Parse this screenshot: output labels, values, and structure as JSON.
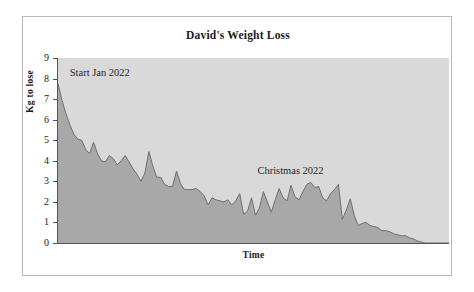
{
  "chart_data": {
    "type": "area",
    "title": "David's Weight Loss",
    "xlabel": "Time",
    "ylabel": "Kg to lose",
    "ylim": [
      0,
      9
    ],
    "ytick_labels": [
      "9",
      "8",
      "7",
      "6",
      "5",
      "4",
      "3",
      "2",
      "1",
      "0"
    ],
    "ytick_values": [
      9,
      8,
      7,
      6,
      5,
      4,
      3,
      2,
      1,
      0
    ],
    "xtick_labels": [],
    "grid": false,
    "legend": false,
    "fill_color": "#a8a8a8",
    "line_color": "#6e6e6e",
    "plot_background": "#d9d9d9",
    "annotations": [
      {
        "text": "Start Jan 2022",
        "x_frac": 0.03,
        "y_value": 8.2
      },
      {
        "text": "Christmas 2022",
        "x_frac": 0.51,
        "y_value": 3.45
      }
    ],
    "series": [
      {
        "name": "Kg to lose",
        "values": [
          7.75,
          6.95,
          6.3,
          5.75,
          5.3,
          5.05,
          5.0,
          4.55,
          4.35,
          4.9,
          4.35,
          4.0,
          3.95,
          4.25,
          4.1,
          3.8,
          4.0,
          4.25,
          3.95,
          3.6,
          3.35,
          3.0,
          3.4,
          4.45,
          3.75,
          3.2,
          3.2,
          2.85,
          2.75,
          2.75,
          3.5,
          2.9,
          2.6,
          2.6,
          2.6,
          2.65,
          2.5,
          2.3,
          1.85,
          2.2,
          2.1,
          2.05,
          2.0,
          2.1,
          1.85,
          2.05,
          2.4,
          1.4,
          1.55,
          2.2,
          1.35,
          1.7,
          2.5,
          2.0,
          1.5,
          2.1,
          2.65,
          2.2,
          2.05,
          2.8,
          2.25,
          2.1,
          2.5,
          2.85,
          2.95,
          2.7,
          2.75,
          2.2,
          2.05,
          2.4,
          2.6,
          2.85,
          1.15,
          1.6,
          2.15,
          1.35,
          0.85,
          0.95,
          1.0,
          0.85,
          0.8,
          0.75,
          0.6,
          0.6,
          0.55,
          0.45,
          0.4,
          0.35,
          0.35,
          0.25,
          0.2,
          0.1,
          0.05,
          0.0,
          0.0,
          0.0,
          0.0,
          0.0,
          0.0,
          0.0
        ]
      }
    ]
  },
  "title": {
    "text": "David's Weight Loss"
  }
}
